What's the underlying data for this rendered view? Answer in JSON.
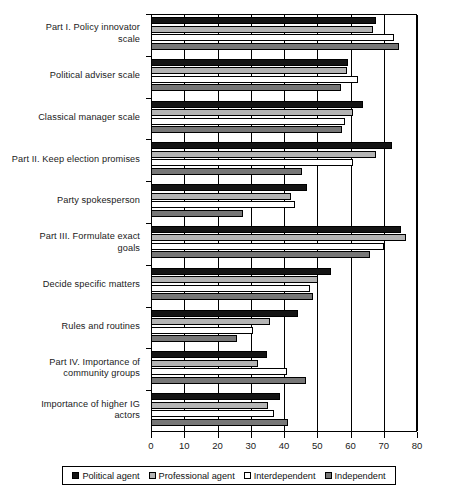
{
  "chart_data": {
    "type": "bar",
    "orientation": "horizontal",
    "title": "",
    "xlabel": "",
    "ylabel": "",
    "xlim": [
      0,
      80
    ],
    "xticks": [
      0,
      10,
      20,
      30,
      40,
      50,
      60,
      70,
      80
    ],
    "grid": true,
    "legend_position": "bottom",
    "categories": [
      "Part I. Policy innovator scale",
      "Political adviser scale",
      "Classical manager scale",
      "Part II. Keep election promises",
      "Party spokesperson",
      "Part III. Formulate exact goals",
      "Decide specific matters",
      "Rules and routines",
      "Part IV. Importance of community groups",
      "Importance of higher IG actors"
    ],
    "category_lines": [
      [
        "Part I. Policy innovator",
        "scale"
      ],
      [
        "Political adviser scale"
      ],
      [
        "Classical manager scale"
      ],
      [
        "Part II. Keep election promises"
      ],
      [
        "Party spokesperson"
      ],
      [
        "Part III. Formulate exact",
        "goals"
      ],
      [
        "Decide specific matters"
      ],
      [
        "Rules and routines"
      ],
      [
        "Part IV. Importance of",
        "community groups"
      ],
      [
        "Importance of higher IG",
        "actors"
      ]
    ],
    "series": [
      {
        "name": "Political agent",
        "color": "#141414",
        "values": [
          67.7,
          59.2,
          63.8,
          72.5,
          46.9,
          75.2,
          54.1,
          44.2,
          34.8,
          38.8
        ]
      },
      {
        "name": "Professional agent",
        "color": "#b4b4b4",
        "values": [
          66.8,
          59.0,
          60.8,
          67.6,
          42.1,
          76.7,
          50.3,
          35.8,
          32.3,
          35.2
        ]
      },
      {
        "name": "Interdependent",
        "color": "#ffffff",
        "values": [
          73.1,
          62.2,
          58.3,
          60.8,
          43.3,
          70.1,
          47.8,
          30.7,
          40.8,
          37.0
        ]
      },
      {
        "name": "Independent",
        "color": "#777777",
        "values": [
          74.6,
          57.1,
          57.4,
          45.3,
          27.7,
          65.9,
          48.8,
          25.8,
          46.5,
          41.2
        ]
      }
    ]
  }
}
